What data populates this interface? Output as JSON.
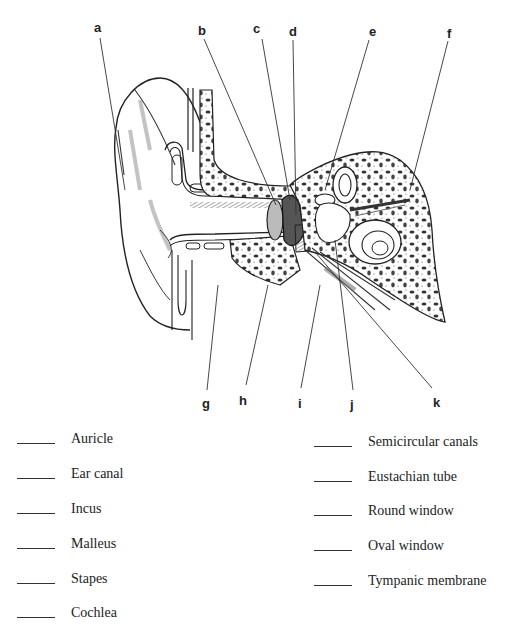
{
  "diagram": {
    "letters": [
      {
        "id": "a",
        "x": 96,
        "y": 22
      },
      {
        "id": "b",
        "x": 199,
        "y": 22
      },
      {
        "id": "c",
        "x": 254,
        "y": 20
      },
      {
        "id": "d",
        "x": 290,
        "y": 23
      },
      {
        "id": "e",
        "x": 370,
        "y": 23
      },
      {
        "id": "f",
        "x": 446,
        "y": 25
      },
      {
        "id": "g",
        "x": 203,
        "y": 397
      },
      {
        "id": "h",
        "x": 239,
        "y": 395
      },
      {
        "id": "i",
        "x": 297,
        "y": 397
      },
      {
        "id": "j",
        "x": 350,
        "y": 399
      },
      {
        "id": "k",
        "x": 435,
        "y": 396
      }
    ]
  },
  "terms": {
    "left": [
      "Auricle",
      "Ear canal",
      "Incus",
      "Malleus",
      "Stapes",
      "Cochlea"
    ],
    "right": [
      "Semicircular canals",
      "Eustachian tube",
      "Round window",
      "Oval window",
      "Tympanic membrane"
    ]
  }
}
